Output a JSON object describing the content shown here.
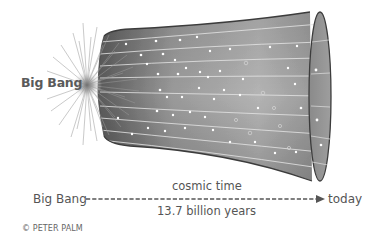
{
  "figure": {
    "title_label": "Big Bang"
  },
  "timeline": {
    "start_label": "Big Bang",
    "end_label": "today",
    "axis_label": "cosmic time",
    "duration_label": "13.7 billion years"
  },
  "credit": "© PETER PALM",
  "colors": {
    "funnel_fill_dark": "#6e6e6e",
    "funnel_fill_light": "#b8b8b8",
    "funnel_outline": "#3c3c3c",
    "grid_lines": "#e0e0e0",
    "stars": "#ffffff",
    "text": "#555555",
    "burst": "#888888"
  },
  "icons": {
    "starburst": "big-bang-starburst",
    "arrow": "arrow-right"
  }
}
